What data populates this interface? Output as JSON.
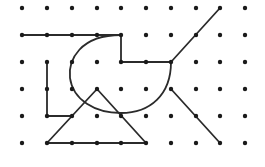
{
  "canvas": {
    "width": 265,
    "height": 167,
    "background": "#ffffff"
  },
  "style": {
    "stroke": "#2b2b2b",
    "dot": "#1a1a1a",
    "stroke_width": 1.8,
    "dot_radius": 2.2
  },
  "grid": {
    "columns": [
      22,
      47,
      72,
      97,
      121,
      146,
      171,
      196,
      220,
      245
    ],
    "rows": [
      8,
      35,
      62,
      89,
      116,
      143
    ]
  },
  "shapes": [
    {
      "name": "top-bracket-polyline",
      "type": "polyline",
      "points": [
        [
          22,
          35
        ],
        [
          121,
          35
        ],
        [
          121,
          62
        ],
        [
          171,
          62
        ]
      ]
    },
    {
      "name": "diagonal-line-upper-right",
      "type": "line",
      "points": [
        [
          171,
          62
        ],
        [
          220,
          8
        ]
      ]
    },
    {
      "name": "curved-arc",
      "type": "path",
      "d": "M121,35 C80,35 68,60 70,78 C73,100 95,113 121,113 C150,113 171,95 171,62"
    },
    {
      "name": "l-shape-polyline",
      "type": "polyline",
      "points": [
        [
          47,
          62
        ],
        [
          47,
          116
        ],
        [
          72,
          116
        ]
      ]
    },
    {
      "name": "triangle",
      "type": "polygon",
      "points": [
        [
          47,
          143
        ],
        [
          97,
          89
        ],
        [
          146,
          143
        ]
      ]
    },
    {
      "name": "diagonal-line-lower-right",
      "type": "line",
      "points": [
        [
          171,
          89
        ],
        [
          220,
          143
        ]
      ]
    }
  ]
}
